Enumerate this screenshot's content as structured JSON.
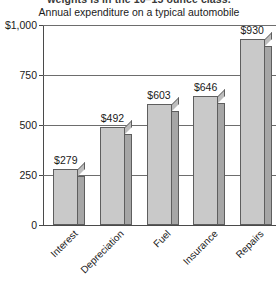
{
  "page": {
    "clipped_text_above": "weights is in the 10–15 ounce class."
  },
  "chart_data": {
    "type": "bar",
    "title": "Annual expenditure on a typical automobile",
    "xlabel": "",
    "ylabel": "",
    "categories": [
      "Interest",
      "Depreciation",
      "Fuel",
      "Insurance",
      "Repairs"
    ],
    "values": [
      279,
      492,
      603,
      646,
      930
    ],
    "data_labels": [
      "$279",
      "$492",
      "$603",
      "$646",
      "$930"
    ],
    "ylim": [
      0,
      1000
    ],
    "yticks": [
      0,
      250,
      500,
      750,
      1000
    ],
    "ytick_labels": [
      "0",
      "250",
      "500",
      "750",
      "$1,000"
    ],
    "grid": true,
    "legend": "none",
    "style": {
      "bar_face_color": "#c9c9c9",
      "bar_side_color": "#a6a6a6",
      "bar_outline_color": "#5e5e5e",
      "axis_color": "#4a4a4a",
      "gridline_color": "#6d6d6d",
      "background_color": "#ffffff"
    }
  }
}
